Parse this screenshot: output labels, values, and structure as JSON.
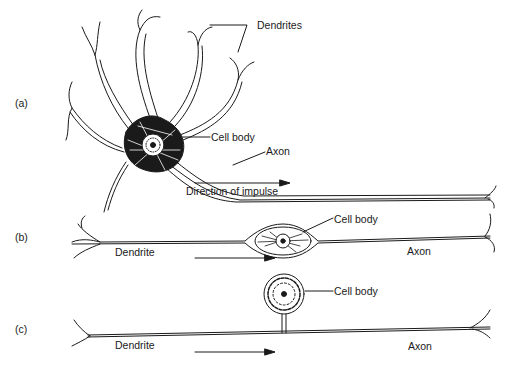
{
  "figure": {
    "panels": [
      {
        "id": "a",
        "label": "(a)",
        "annotations": {
          "dendrites": "Dendrites",
          "cell_body": "Cell body",
          "axon": "Axon",
          "direction": "Direction of impulse"
        }
      },
      {
        "id": "b",
        "label": "(b)",
        "annotations": {
          "cell_body": "Cell body",
          "dendrite": "Dendrite",
          "axon": "Axon"
        }
      },
      {
        "id": "c",
        "label": "(c)",
        "annotations": {
          "cell_body": "Cell body",
          "dendrite": "Dendrite",
          "axon": "Axon"
        }
      }
    ],
    "colors": {
      "ink": "#1a1a1a",
      "background": "#ffffff"
    }
  }
}
